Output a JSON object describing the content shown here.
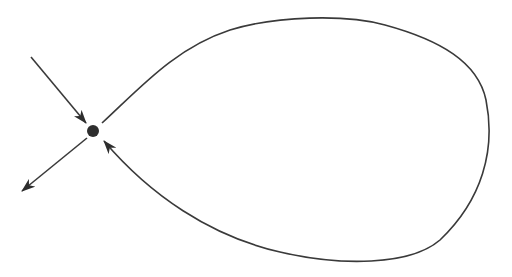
{
  "diagram": {
    "type": "phase-portrait-homoclinic-loop",
    "canvas": {
      "width": 512,
      "height": 277,
      "background": "#ffffff"
    },
    "colors": {
      "stroke": "#3a3a3a",
      "point": "#2e2e2e"
    },
    "saddle_point": {
      "cx": 93,
      "cy": 131,
      "r": 6
    },
    "incoming_arrow": {
      "from": [
        31,
        57
      ],
      "to": [
        86,
        123
      ],
      "direction": "toward-saddle"
    },
    "outgoing_arrow": {
      "from": [
        87,
        138
      ],
      "to": [
        22,
        191
      ],
      "direction": "away-from-saddle"
    },
    "homoclinic_loop": {
      "path": "M 102 123 C 140 88, 175 48, 230 30 C 275 16, 345 14, 385 25 C 440 40, 478 62, 486 100 C 496 150, 482 200, 440 240 C 410 266, 340 266, 280 252 C 210 236, 150 195, 104 141",
      "arrow_at_end": true,
      "direction": "returns-to-saddle"
    },
    "labels": []
  }
}
